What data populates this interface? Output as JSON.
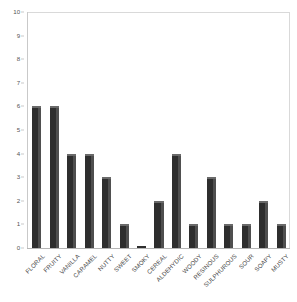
{
  "chart_data": {
    "type": "bar",
    "title": "",
    "subtitle": "",
    "xlabel": "",
    "ylabel": "",
    "categories": [
      "FLORAL",
      "FRUITY",
      "VANILLA",
      "CARAMEL",
      "NUTTY",
      "SWEET",
      "SMOKY",
      "CEREAL",
      "ALDEHYDIC",
      "WOODY",
      "RESINOUS",
      "SULPHUROUS",
      "SOUR",
      "SOAPY",
      "MUSTY"
    ],
    "values": [
      6,
      6,
      4,
      4,
      3,
      1,
      0,
      2,
      4,
      1,
      3,
      1,
      1,
      2,
      1
    ],
    "ylim": [
      0,
      10
    ],
    "ytick_labels": [
      "0",
      "1",
      "2",
      "3",
      "4",
      "5",
      "6",
      "7",
      "8",
      "9",
      "10"
    ],
    "ytick_values": [
      0,
      1,
      2,
      3,
      4,
      5,
      6,
      7,
      8,
      9,
      10
    ],
    "grid": false,
    "legend": null,
    "legend_position": "none",
    "bar_color": "#2e2e2e",
    "bar_face_color": "#4f4f4f",
    "bar_cap_color": "#6a6a6a",
    "frame_color": "#d9d9d9",
    "axis_color": "#b5b5b5",
    "tick_label_color": "#555555",
    "category_label_color": "#4a4a4a",
    "background_color": "#ffffff",
    "label_rotation_degrees": 45
  }
}
